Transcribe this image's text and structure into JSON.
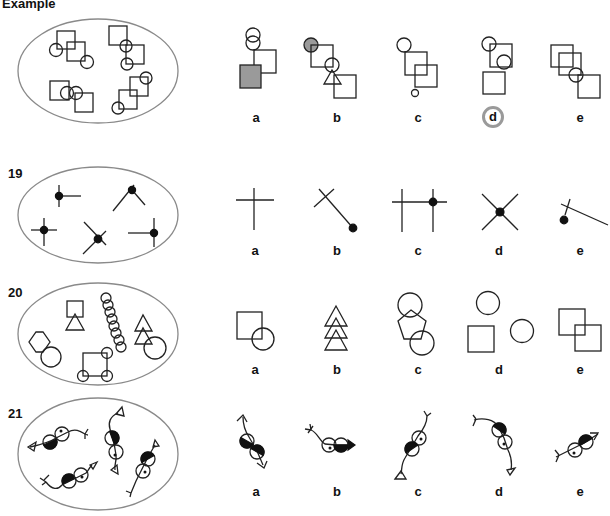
{
  "title": "Example",
  "answer_highlight_color": "#9a9a9a",
  "rows": [
    {
      "id": "example",
      "label": "Example",
      "options": [
        "a",
        "b",
        "c",
        "d",
        "e"
      ],
      "circled_answer": "d",
      "set_description": "Oval containing four groups, each made of two overlapping squares and two circles"
    },
    {
      "id": "19",
      "label": "19",
      "options": [
        "a",
        "b",
        "c",
        "d",
        "e"
      ],
      "set_description": "Oval containing five figures: a black dot at the junction of lines"
    },
    {
      "id": "20",
      "label": "20",
      "options": [
        "a",
        "b",
        "c",
        "d",
        "e"
      ],
      "set_description": "Oval containing shape groups: square+triangle, chain of circles, hexagon+circle, two triangles+circle, square with circles at corners"
    },
    {
      "id": "21",
      "label": "21",
      "options": [
        "a",
        "b",
        "c",
        "d",
        "e"
      ],
      "set_description": "Oval containing four figures: two circles (one half black, one with dot) on a curved line with arrow/fork ends"
    }
  ],
  "labels": {
    "example": {
      "a": "a",
      "b": "b",
      "c": "c",
      "d": "d",
      "e": "e"
    },
    "r19": {
      "a": "a",
      "b": "b",
      "c": "c",
      "d": "d",
      "e": "e"
    },
    "r20": {
      "a": "a",
      "b": "b",
      "c": "c",
      "d": "d",
      "e": "e"
    },
    "r21": {
      "a": "a",
      "b": "b",
      "c": "c",
      "d": "d",
      "e": "e"
    }
  }
}
